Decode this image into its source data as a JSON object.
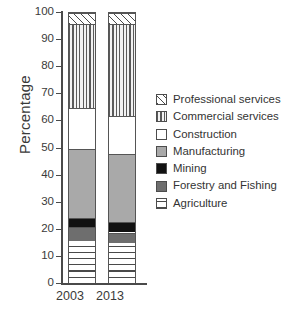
{
  "chart_data": {
    "type": "bar",
    "subtype": "stacked-percentage",
    "title": "",
    "xlabel": "",
    "ylabel": "Percentage",
    "ylim": [
      0,
      100
    ],
    "ytick_labels": [
      "100",
      "90",
      "80",
      "70",
      "60",
      "50",
      "40",
      "30",
      "20",
      "10",
      "0"
    ],
    "ytick_values": [
      100,
      90,
      80,
      70,
      60,
      50,
      40,
      30,
      20,
      10,
      0
    ],
    "grid": false,
    "legend_position": "right",
    "categories": [
      "2003",
      "2013"
    ],
    "series": [
      {
        "name": "Professional services",
        "values": [
          4,
          4
        ],
        "fill": "diagonal-hatch",
        "color": "#ffffff"
      },
      {
        "name": "Commercial services",
        "values": [
          31,
          34
        ],
        "fill": "vertical-stripes",
        "color": "#f2f2f2"
      },
      {
        "name": "Construction",
        "values": [
          15,
          14
        ],
        "fill": "solid",
        "color": "#ffffff"
      },
      {
        "name": "Manufacturing",
        "values": [
          25.5,
          25
        ],
        "fill": "solid",
        "color": "#a9a9a9"
      },
      {
        "name": "Mining",
        "values": [
          3.5,
          4
        ],
        "fill": "solid",
        "color": "#111111"
      },
      {
        "name": "Forestry and Fishing",
        "values": [
          5,
          4
        ],
        "fill": "solid",
        "color": "#6e6e6e"
      },
      {
        "name": "Agriculture",
        "values": [
          16,
          15
        ],
        "fill": "horizontal-stripes",
        "color": "#ffffff"
      }
    ],
    "stack_order_bottom_to_top": [
      "Agriculture",
      "Forestry and Fishing",
      "Mining",
      "Manufacturing",
      "Construction",
      "Commercial services",
      "Professional services"
    ],
    "segments_2003": [
      {
        "name": "Agriculture",
        "from": 0,
        "to": 16
      },
      {
        "name": "Forestry and Fishing",
        "from": 16,
        "to": 21
      },
      {
        "name": "Mining",
        "from": 21,
        "to": 24.5
      },
      {
        "name": "Manufacturing",
        "from": 24.5,
        "to": 50
      },
      {
        "name": "Construction",
        "from": 50,
        "to": 65
      },
      {
        "name": "Commercial services",
        "from": 65,
        "to": 96
      },
      {
        "name": "Professional services",
        "from": 96,
        "to": 100
      }
    ],
    "segments_2013": [
      {
        "name": "Agriculture",
        "from": 0,
        "to": 15
      },
      {
        "name": "Forestry and Fishing",
        "from": 15,
        "to": 19
      },
      {
        "name": "Mining",
        "from": 19,
        "to": 23
      },
      {
        "name": "Manufacturing",
        "from": 23,
        "to": 48
      },
      {
        "name": "Construction",
        "from": 48,
        "to": 62
      },
      {
        "name": "Commercial services",
        "from": 62,
        "to": 96
      },
      {
        "name": "Professional services",
        "from": 96,
        "to": 100
      }
    ]
  },
  "axis": {
    "y_label": "Percentage",
    "y_ticks": [
      "100",
      "90",
      "80",
      "70",
      "60",
      "50",
      "40",
      "30",
      "20",
      "10",
      "0"
    ],
    "x_ticks": [
      "2003",
      "2013"
    ]
  },
  "legend": {
    "items": [
      {
        "label": "Professional services",
        "swatch": "diagonal-hatch-swatch"
      },
      {
        "label": "Commercial services",
        "swatch": "vertical-stripes-swatch"
      },
      {
        "label": "Construction",
        "swatch": "white-swatch"
      },
      {
        "label": "Manufacturing",
        "swatch": "light-gray-swatch"
      },
      {
        "label": "Mining",
        "swatch": "black-swatch"
      },
      {
        "label": "Forestry and Fishing",
        "swatch": "dark-gray-swatch"
      },
      {
        "label": "Agriculture",
        "swatch": "horizontal-stripes-swatch"
      }
    ]
  }
}
